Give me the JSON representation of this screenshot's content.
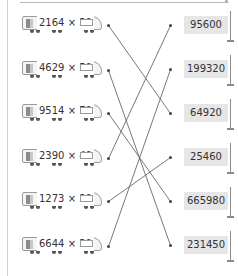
{
  "exercise": {
    "type": "match-multiplication",
    "left_items": [
      {
        "label": "2164 × 30",
        "y": 25
      },
      {
        "label": "4629 × 50",
        "y": 70
      },
      {
        "label": "9514 × 70",
        "y": 113
      },
      {
        "label": "2390 × 40",
        "y": 158
      },
      {
        "label": "1273 × 20",
        "y": 201
      },
      {
        "label": "6644 × 30",
        "y": 246
      }
    ],
    "right_items": [
      {
        "label": "95600",
        "y": 25
      },
      {
        "label": "199320",
        "y": 69
      },
      {
        "label": "64920",
        "y": 113
      },
      {
        "label": "25460",
        "y": 157
      },
      {
        "label": "665980",
        "y": 201
      },
      {
        "label": "231450",
        "y": 245
      }
    ],
    "connections": [
      {
        "from": 0,
        "to": 2
      },
      {
        "from": 1,
        "to": 5
      },
      {
        "from": 2,
        "to": 4
      },
      {
        "from": 3,
        "to": 0
      },
      {
        "from": 4,
        "to": 3
      },
      {
        "from": 5,
        "to": 1
      }
    ]
  },
  "colors": {
    "line": "#555555",
    "answer_box": "#e6e6e6",
    "text": "#333333"
  }
}
